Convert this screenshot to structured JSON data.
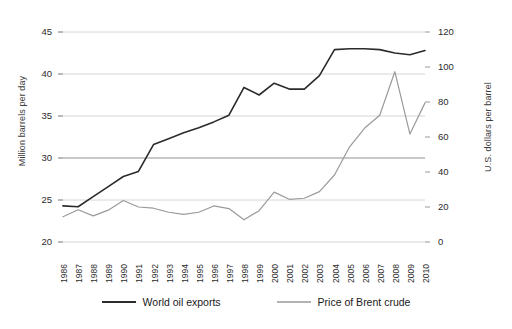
{
  "chart_data": {
    "type": "line",
    "title": "",
    "xlabel": "",
    "ylabel": "Million barrels per day",
    "y2label": "U.S. dollars per barrel",
    "grid": true,
    "legend_position": "bottom",
    "x": [
      1986,
      1987,
      1988,
      1989,
      1990,
      1991,
      1992,
      1993,
      1994,
      1995,
      1996,
      1997,
      1998,
      1999,
      2000,
      2001,
      2002,
      2003,
      2004,
      2005,
      2006,
      2007,
      2008,
      2009,
      2010
    ],
    "xtick_labels": [
      "1986",
      "1987",
      "1988",
      "1989",
      "1990",
      "1991",
      "1992",
      "1993",
      "1994",
      "1995",
      "1996",
      "1997",
      "1998",
      "1999",
      "2000",
      "2001",
      "2002",
      "2003",
      "2004",
      "2005",
      "2006",
      "2007",
      "2008",
      "2009",
      "2010"
    ],
    "ylim": [
      20,
      45
    ],
    "ytick_labels": [
      "20",
      "25",
      "30",
      "35",
      "40",
      "45"
    ],
    "yticks": [
      20,
      25,
      30,
      35,
      40,
      45
    ],
    "y2lim": [
      0,
      120
    ],
    "y2tick_labels": [
      "0",
      "20",
      "40",
      "60",
      "80",
      "100",
      "120"
    ],
    "y2ticks": [
      0,
      20,
      40,
      60,
      80,
      100,
      120
    ],
    "series": [
      {
        "name": "World oil exports",
        "axis": "left",
        "color": "#2b2b2b",
        "values": [
          24.3,
          24.2,
          25.4,
          26.6,
          27.8,
          28.4,
          31.6,
          32.3,
          33.0,
          33.6,
          34.3,
          35.1,
          38.4,
          37.5,
          38.9,
          38.2,
          38.2,
          39.8,
          42.9,
          43.0,
          43.0,
          42.9,
          42.5,
          42.3,
          42.8
        ]
      },
      {
        "name": "Price of Brent crude",
        "axis": "right",
        "color": "#9a9a9a",
        "values": [
          14.4,
          18.4,
          14.9,
          18.2,
          23.7,
          20.0,
          19.3,
          17.0,
          15.8,
          17.0,
          20.6,
          19.1,
          12.7,
          17.9,
          28.5,
          24.4,
          25.0,
          28.8,
          38.3,
          54.4,
          65.1,
          72.4,
          97.3,
          61.7,
          79.5
        ]
      }
    ]
  },
  "axes": {
    "left_title": "Million barrels per day",
    "right_title": "U.S. dollars per barrel"
  },
  "legend": {
    "items": [
      {
        "label": "World oil exports",
        "color": "#2b2b2b"
      },
      {
        "label": "Price of Brent crude",
        "color": "#9a9a9a"
      }
    ]
  }
}
